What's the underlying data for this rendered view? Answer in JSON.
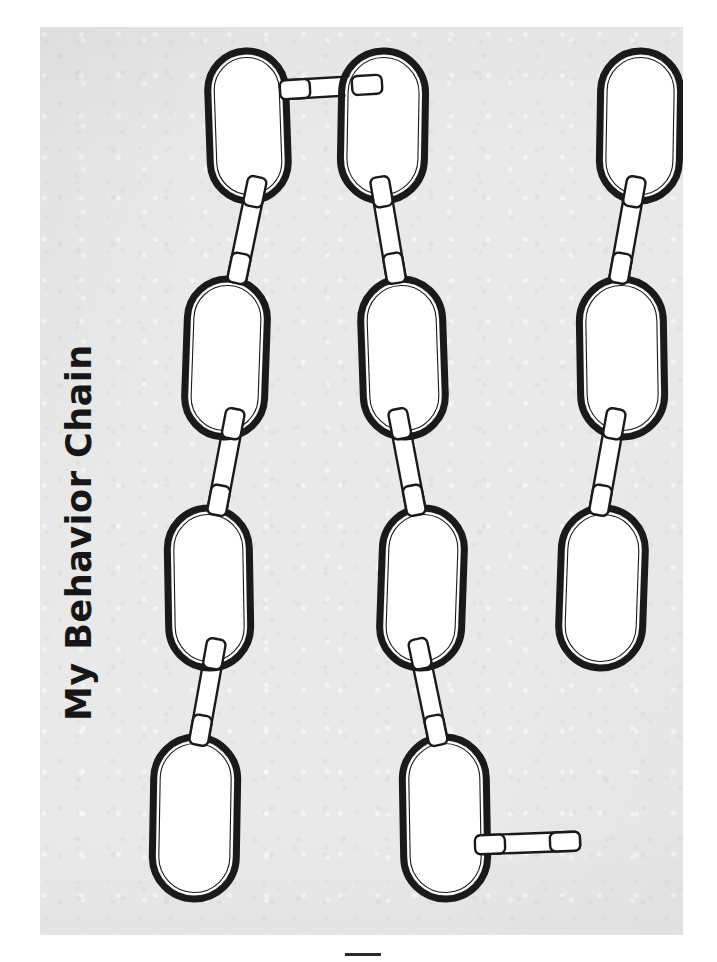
{
  "document": {
    "kind": "worksheet",
    "title": "My Behavior Chain",
    "title_orientation": "rotated-90-ccw",
    "page_background_color": "#e9e9e9",
    "canvas_background_color": "#ffffff",
    "ink_color": "#1a1a1a",
    "link_fill_color": "#ffffff",
    "connector_fill_color": "#ffffff",
    "bottom_mark_color": "#2b2b2b"
  },
  "legend": {
    "link_shape": "stadium",
    "connector_shape": "rounded-bar",
    "notes": "blank fill-in chain-link worksheet; no text inside links"
  },
  "chart_data": {
    "type": "diagram",
    "title": "My Behavior Chain",
    "xlabel": "",
    "ylabel": "",
    "columns": 3,
    "rows": 4,
    "link_count": 11,
    "connector_count": 10,
    "links": [
      {
        "id": "L1",
        "col": 1,
        "row": 1,
        "cx": 208,
        "cy": 99,
        "w": 78,
        "h": 150,
        "rot": -2,
        "label": ""
      },
      {
        "id": "L2",
        "col": 1,
        "row": 2,
        "cx": 186,
        "cy": 331,
        "w": 80,
        "h": 158,
        "rot": 2,
        "label": ""
      },
      {
        "id": "L3",
        "col": 1,
        "row": 3,
        "cx": 169,
        "cy": 561,
        "w": 82,
        "h": 160,
        "rot": -1,
        "label": ""
      },
      {
        "id": "L4",
        "col": 1,
        "row": 4,
        "cx": 155,
        "cy": 791,
        "w": 84,
        "h": 162,
        "rot": 1,
        "label": ""
      },
      {
        "id": "L5",
        "col": 2,
        "row": 1,
        "cx": 343,
        "cy": 99,
        "w": 84,
        "h": 150,
        "rot": 1,
        "label": ""
      },
      {
        "id": "L6",
        "col": 2,
        "row": 2,
        "cx": 363,
        "cy": 331,
        "w": 82,
        "h": 158,
        "rot": -2,
        "label": ""
      },
      {
        "id": "L7",
        "col": 2,
        "row": 3,
        "cx": 382,
        "cy": 561,
        "w": 82,
        "h": 160,
        "rot": 2,
        "label": ""
      },
      {
        "id": "L8",
        "col": 2,
        "row": 4,
        "cx": 405,
        "cy": 791,
        "w": 84,
        "h": 162,
        "rot": -1,
        "label": ""
      },
      {
        "id": "L9",
        "col": 3,
        "row": 1,
        "cx": 600,
        "cy": 99,
        "w": 80,
        "h": 150,
        "rot": 1,
        "label": ""
      },
      {
        "id": "L10",
        "col": 3,
        "row": 2,
        "cx": 582,
        "cy": 331,
        "w": 84,
        "h": 158,
        "rot": -1,
        "label": ""
      },
      {
        "id": "L11",
        "col": 3,
        "row": 3,
        "cx": 562,
        "cy": 561,
        "w": 84,
        "h": 160,
        "rot": 2,
        "label": ""
      }
    ],
    "connectors": [
      {
        "id": "C1",
        "from": "L1",
        "to": "L5",
        "x1": 240,
        "y1": 63,
        "x2": 342,
        "y2": 57,
        "orientation": "horizontal"
      },
      {
        "id": "C2",
        "from": "L1",
        "to": "L2",
        "x1": 218,
        "y1": 150,
        "x2": 196,
        "y2": 256,
        "orientation": "diagonal"
      },
      {
        "id": "C3",
        "from": "L2",
        "to": "L3",
        "x1": 196,
        "y1": 382,
        "x2": 176,
        "y2": 488,
        "orientation": "diagonal"
      },
      {
        "id": "C4",
        "from": "L3",
        "to": "L4",
        "x1": 177,
        "y1": 612,
        "x2": 158,
        "y2": 718,
        "orientation": "diagonal"
      },
      {
        "id": "C5",
        "from": "L5",
        "to": "L6",
        "x1": 339,
        "y1": 150,
        "x2": 357,
        "y2": 256,
        "orientation": "diagonal"
      },
      {
        "id": "C6",
        "from": "L6",
        "to": "L7",
        "x1": 357,
        "y1": 382,
        "x2": 377,
        "y2": 488,
        "orientation": "diagonal"
      },
      {
        "id": "C7",
        "from": "L7",
        "to": "L8",
        "x1": 377,
        "y1": 612,
        "x2": 399,
        "y2": 718,
        "orientation": "diagonal"
      },
      {
        "id": "C8",
        "from": "L8",
        "to": "L11",
        "x1": 435,
        "y1": 818,
        "x2": 540,
        "y2": 814,
        "orientation": "horizontal"
      },
      {
        "id": "C9",
        "from": "L9",
        "to": "L10",
        "x1": 597,
        "y1": 150,
        "x2": 578,
        "y2": 256,
        "orientation": "diagonal"
      },
      {
        "id": "C10",
        "from": "L10",
        "to": "L11",
        "x1": 577,
        "y1": 382,
        "x2": 558,
        "y2": 488,
        "orientation": "diagonal"
      }
    ]
  }
}
